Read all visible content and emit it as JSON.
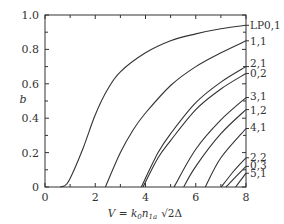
{
  "chart_data": {
    "type": "line",
    "title": "",
    "xlabel": "V = k0 n1a √2Δ",
    "xlabel_parts": {
      "main": "V = k",
      "sub0": "0",
      "n": "n",
      "sub1": "1a",
      "sqrt": "√2Δ"
    },
    "ylabel": "b",
    "xlim": [
      0,
      8
    ],
    "ylim": [
      0,
      1.0
    ],
    "x_ticks": [
      "0",
      "2",
      "4",
      "6",
      "8"
    ],
    "y_ticks": [
      "0",
      "0.2",
      "0.4",
      "0.6",
      "0.8",
      "1.0"
    ],
    "grid": false,
    "legend_position": "right-edge inline labels",
    "series": [
      {
        "name": "LP0,1",
        "cutoff": 0.0,
        "b_at_8": 0.94,
        "points": [
          [
            0.6,
            0.0
          ],
          [
            0.8,
            0.01
          ],
          [
            1.0,
            0.05
          ],
          [
            1.5,
            0.22
          ],
          [
            2.0,
            0.42
          ],
          [
            2.5,
            0.57
          ],
          [
            3.0,
            0.67
          ],
          [
            4.0,
            0.78
          ],
          [
            5.0,
            0.85
          ],
          [
            6.0,
            0.89
          ],
          [
            7.0,
            0.92
          ],
          [
            8.0,
            0.94
          ]
        ]
      },
      {
        "name": "1,1",
        "cutoff": 2.405,
        "b_at_8": 0.85,
        "points": [
          [
            2.405,
            0.0
          ],
          [
            3.0,
            0.2
          ],
          [
            3.5,
            0.33
          ],
          [
            4.0,
            0.43
          ],
          [
            5.0,
            0.59
          ],
          [
            6.0,
            0.7
          ],
          [
            7.0,
            0.78
          ],
          [
            8.0,
            0.85
          ]
        ]
      },
      {
        "name": "2,1",
        "cutoff": 3.832,
        "b_at_8": 0.7,
        "points": [
          [
            3.832,
            0.0
          ],
          [
            4.5,
            0.2
          ],
          [
            5.0,
            0.31
          ],
          [
            6.0,
            0.49
          ],
          [
            7.0,
            0.61
          ],
          [
            8.0,
            0.7
          ]
        ]
      },
      {
        "name": "0,2",
        "cutoff": 3.832,
        "b_at_8": 0.66,
        "points": [
          [
            3.9,
            0.0
          ],
          [
            4.5,
            0.17
          ],
          [
            5.0,
            0.27
          ],
          [
            6.0,
            0.45
          ],
          [
            7.0,
            0.57
          ],
          [
            8.0,
            0.66
          ]
        ]
      },
      {
        "name": "3,1",
        "cutoff": 5.136,
        "b_at_8": 0.52,
        "points": [
          [
            5.136,
            0.0
          ],
          [
            6.0,
            0.22
          ],
          [
            7.0,
            0.39
          ],
          [
            8.0,
            0.52
          ]
        ]
      },
      {
        "name": "1,2",
        "cutoff": 5.52,
        "b_at_8": 0.45,
        "points": [
          [
            5.52,
            0.0
          ],
          [
            6.0,
            0.12
          ],
          [
            7.0,
            0.31
          ],
          [
            8.0,
            0.45
          ]
        ]
      },
      {
        "name": "4,1",
        "cutoff": 6.38,
        "b_at_8": 0.34,
        "points": [
          [
            6.38,
            0.0
          ],
          [
            7.0,
            0.17
          ],
          [
            8.0,
            0.34
          ]
        ]
      },
      {
        "name": "2,2",
        "cutoff": 7.016,
        "b_at_8": 0.17,
        "points": [
          [
            7.016,
            0.0
          ],
          [
            7.5,
            0.09
          ],
          [
            8.0,
            0.17
          ]
        ]
      },
      {
        "name": "0,3",
        "cutoff": 7.016,
        "b_at_8": 0.12,
        "points": [
          [
            7.2,
            0.0
          ],
          [
            7.6,
            0.06
          ],
          [
            8.0,
            0.12
          ]
        ]
      },
      {
        "name": "5,1",
        "cutoff": 7.588,
        "b_at_8": 0.08,
        "points": [
          [
            7.588,
            0.0
          ],
          [
            8.0,
            0.08
          ]
        ]
      }
    ],
    "label_positions_b": [
      0.94,
      0.85,
      0.72,
      0.66,
      0.53,
      0.445,
      0.35,
      0.175,
      0.13,
      0.08
    ]
  },
  "colors": {
    "axis": "#333333",
    "curve": "#333333",
    "background": "#ffffff"
  }
}
